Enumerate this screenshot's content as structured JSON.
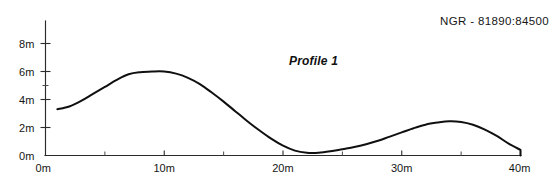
{
  "annotations": {
    "ngr_label": "NGR - 81890:84500",
    "profile_label": "Profile 1"
  },
  "chart_data": {
    "type": "line",
    "title": "Profile 1",
    "xlabel": "",
    "ylabel": "",
    "xlim": [
      0,
      40
    ],
    "ylim": [
      0,
      9
    ],
    "grid": false,
    "legend": null,
    "x_ticklabels": [
      "0m",
      "10m",
      "20m",
      "30m",
      "40m"
    ],
    "x_tickvalues": [
      0,
      10,
      20,
      30,
      40
    ],
    "x_minor_tickvalues": [
      5,
      15,
      25,
      35
    ],
    "y_ticklabels": [
      "0m",
      "2m",
      "4m",
      "6m",
      "8m"
    ],
    "y_tickvalues": [
      0,
      2,
      4,
      6,
      8
    ],
    "series": [
      {
        "name": "Profile 1",
        "x": [
          1.0,
          2.0,
          3.0,
          4.0,
          5.0,
          6.0,
          7.0,
          8.0,
          9.0,
          10.0,
          11.0,
          12.0,
          13.0,
          14.0,
          15.0,
          16.0,
          17.0,
          18.0,
          19.0,
          20.0,
          21.0,
          22.0,
          23.0,
          24.0,
          25.0,
          26.0,
          27.0,
          28.0,
          29.0,
          30.0,
          31.0,
          32.0,
          33.0,
          34.0,
          35.0,
          36.0,
          37.0,
          38.0,
          39.0,
          40.0
        ],
        "y": [
          3.3,
          3.5,
          3.9,
          4.4,
          4.9,
          5.4,
          5.8,
          5.95,
          6.0,
          6.0,
          5.85,
          5.55,
          5.1,
          4.5,
          3.85,
          3.15,
          2.45,
          1.8,
          1.2,
          0.7,
          0.35,
          0.2,
          0.2,
          0.3,
          0.45,
          0.6,
          0.8,
          1.05,
          1.35,
          1.65,
          1.95,
          2.2,
          2.35,
          2.45,
          2.4,
          2.2,
          1.85,
          1.4,
          0.85,
          0.4
        ]
      }
    ]
  }
}
